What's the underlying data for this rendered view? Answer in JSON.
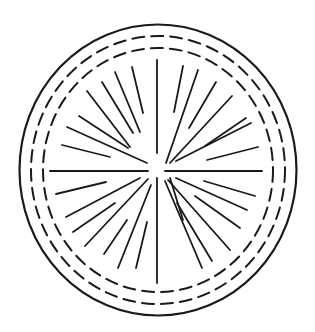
{
  "figure": {
    "colors": {
      "background": "#ffffff",
      "ink": "#1a1a1a"
    },
    "center": [
      158,
      170
    ],
    "outer_ring": {
      "rx": 138.5,
      "ry": 145.5,
      "stroke_width": 2.2
    },
    "dashed_rings": [
      {
        "rx": 127,
        "ry": 134,
        "dash": "12 7",
        "stroke_width": 2
      },
      {
        "rx": 115,
        "ry": 122,
        "dash": "12 7",
        "stroke_width": 2
      }
    ],
    "rays": [
      [
        157,
        60,
        157,
        153
      ],
      [
        132,
        67,
        143,
        113
      ],
      [
        115,
        72,
        140,
        132
      ],
      [
        102,
        82,
        133,
        133
      ],
      [
        87,
        91,
        130,
        147
      ],
      [
        79,
        116,
        128,
        148
      ],
      [
        67,
        127,
        147,
        163
      ],
      [
        62,
        145,
        110,
        157
      ],
      [
        50,
        171,
        148,
        171
      ],
      [
        56,
        194,
        106,
        182
      ],
      [
        66,
        217,
        140,
        178
      ],
      [
        73,
        232,
        115,
        203
      ],
      [
        85,
        246,
        148,
        179
      ],
      [
        104,
        254,
        127,
        220
      ],
      [
        118,
        268,
        151,
        185
      ],
      [
        136,
        268,
        147,
        222
      ],
      [
        157,
        178,
        157,
        283
      ],
      [
        170,
        178,
        183,
        220
      ],
      [
        165,
        181,
        202,
        268
      ],
      [
        177,
        203,
        212,
        261
      ],
      [
        168,
        180,
        230,
        250
      ],
      [
        195,
        196,
        240,
        228
      ],
      [
        176,
        178,
        247,
        210
      ],
      [
        204,
        181,
        255,
        196
      ],
      [
        165,
        171,
        262,
        171
      ],
      [
        207,
        160,
        258,
        147
      ],
      [
        176,
        161,
        251,
        123
      ],
      [
        205,
        146,
        246,
        118
      ],
      [
        170,
        163,
        232,
        96
      ],
      [
        189,
        128,
        216,
        82
      ],
      [
        166,
        163,
        198,
        70
      ],
      [
        174,
        112,
        183,
        66
      ]
    ]
  }
}
